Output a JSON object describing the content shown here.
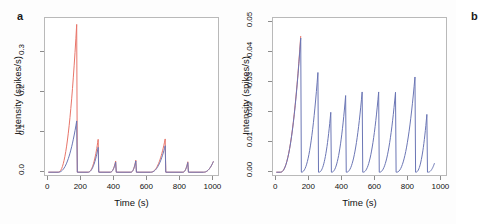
{
  "figure": {
    "background": "#fdfdfd",
    "panels": [
      {
        "label": "a",
        "xlabel": "Time (s)",
        "ylabel": "Intensity (spikes/s)",
        "xticks": [
          "0",
          "200",
          "400",
          "600",
          "800",
          "1000"
        ],
        "yticks": [
          "0.0",
          "0.1",
          "0.2",
          "0.3"
        ]
      },
      {
        "label": "b",
        "xlabel": "Time (s)",
        "ylabel": "Intensity (spikes/s)",
        "xticks": [
          "0",
          "200",
          "400",
          "600",
          "800",
          "1000"
        ],
        "yticks": [
          "0.00",
          "0.01",
          "0.02",
          "0.03",
          "0.04",
          "0.05"
        ]
      }
    ]
  },
  "colors": {
    "series_red": "#e8756a",
    "series_blue": "#6b76b5",
    "frame": "#b9b9b9",
    "text": "#111111"
  },
  "chart_data": [
    {
      "type": "line",
      "title": "",
      "panel": "a",
      "xlabel": "Time (s)",
      "ylabel": "Intensity (spikes/s)",
      "xlim": [
        -20,
        1040
      ],
      "ylim": [
        -0.012,
        0.385
      ],
      "xticks": [
        0,
        200,
        400,
        600,
        800,
        1000
      ],
      "yticks": [
        0.0,
        0.1,
        0.2,
        0.3
      ],
      "grid": false,
      "legend": "none",
      "series": [
        {
          "name": "red-trace",
          "color": "#e8756a",
          "peak_times": [
            172,
            302,
            408,
            530,
            708,
            845,
            1000
          ],
          "peak_values": [
            0.369,
            0.082,
            0.028,
            0.03,
            0.083,
            0.026,
            0.027
          ],
          "baseline": 0.0,
          "onset_times": [
            60,
            240,
            375,
            500,
            620,
            815,
            940
          ]
        },
        {
          "name": "blue-trace",
          "color": "#6b76b5",
          "peak_times": [
            172,
            302,
            408,
            530,
            708,
            845,
            1000
          ],
          "peak_values": [
            0.128,
            0.062,
            0.025,
            0.028,
            0.066,
            0.024,
            0.027
          ],
          "baseline": 0.0,
          "onset_times": [
            60,
            240,
            375,
            500,
            620,
            815,
            940
          ]
        }
      ]
    },
    {
      "type": "line",
      "title": "",
      "panel": "b",
      "xlabel": "Time (s)",
      "ylabel": "Intensity (spikes/s)",
      "xlim": [
        -20,
        1040
      ],
      "ylim": [
        -0.0016,
        0.0515
      ],
      "xticks": [
        0,
        200,
        400,
        600,
        800,
        1000
      ],
      "yticks": [
        0.0,
        0.01,
        0.02,
        0.03,
        0.04,
        0.05
      ],
      "grid": false,
      "legend": "none",
      "series": [
        {
          "name": "red-trace",
          "color": "#e8756a",
          "peak_times": [
            148
          ],
          "peak_values": [
            0.0455
          ],
          "baseline": 0.0,
          "onset_times": [
            25
          ]
        },
        {
          "name": "blue-trace",
          "color": "#6b76b5",
          "peak_times": [
            148,
            252,
            330,
            420,
            520,
            620,
            722,
            840,
            912,
            958
          ],
          "peak_values": [
            0.0448,
            0.0333,
            0.02,
            0.0256,
            0.0268,
            0.0268,
            0.0267,
            0.0318,
            0.0193,
            0.003
          ],
          "baseline": 0.0,
          "onset_times": [
            25,
            152,
            258,
            335,
            425,
            525,
            625,
            728,
            845,
            918
          ]
        }
      ]
    }
  ]
}
